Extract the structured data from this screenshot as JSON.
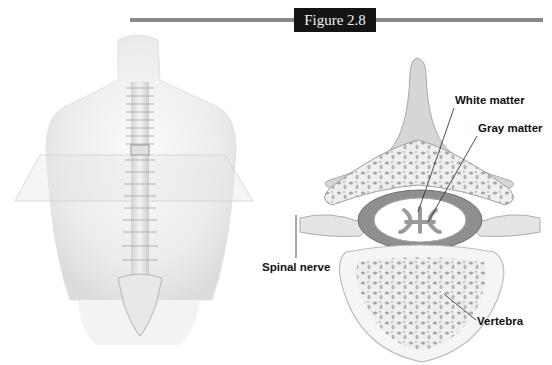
{
  "figure": {
    "badge": "Figure 2.8",
    "rule_color": "#8a8a8a",
    "badge_bg": "#141414"
  },
  "left_panel": {
    "subject": "torso-with-spine",
    "plane": "transverse-section-plane"
  },
  "right_panel": {
    "subject": "vertebra-cross-section",
    "labels": {
      "white_matter": "White matter",
      "gray_matter": "Gray matter",
      "spinal_nerve": "Spinal nerve",
      "vertebra": "Vertebra"
    }
  }
}
